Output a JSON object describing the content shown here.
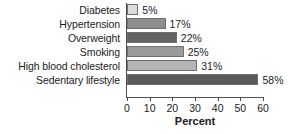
{
  "chart_data": {
    "type": "bar",
    "orientation": "horizontal",
    "title": "",
    "xlabel": "Percent",
    "ylabel": "",
    "categories": [
      "Diabetes",
      "Hypertension",
      "Overweight",
      "Smoking",
      "High blood cholesterol",
      "Sedentary lifestyle"
    ],
    "values": [
      5,
      17,
      22,
      25,
      31,
      58
    ],
    "value_labels": [
      "5%",
      "17%",
      "22%",
      "25%",
      "31%",
      "58%"
    ],
    "bar_colors": [
      "#dcdcdc",
      "#8e8e8e",
      "#636363",
      "#9a9a9a",
      "#b5b5b5",
      "#5a5a5a"
    ],
    "xlim": [
      0,
      60
    ],
    "xticks": [
      0,
      10,
      20,
      30,
      40,
      50,
      60
    ],
    "xtick_labels": [
      "0",
      "10",
      "20",
      "30",
      "40",
      "50",
      "60"
    ],
    "grid": false,
    "legend": null
  },
  "style": {
    "axis_color": "#4d4d4d",
    "bar_border_color": "#6f6f6f",
    "text_color": "#1b1b1b",
    "background": "#ffffff"
  }
}
